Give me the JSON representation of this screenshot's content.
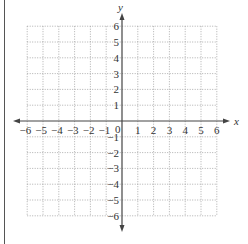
{
  "diagram": {
    "type": "coordinate-grid",
    "axes": {
      "x_label": "x",
      "y_label": "y",
      "x_min": -6,
      "x_max": 6,
      "y_min": -6,
      "y_max": 6,
      "origin_label": "0"
    },
    "x_tick_labels": [
      "−6",
      "−5",
      "−4",
      "−3",
      "−2",
      "−1",
      "1",
      "2",
      "3",
      "4",
      "5",
      "6"
    ],
    "y_tick_labels_positive": [
      "1",
      "2",
      "3",
      "4",
      "5",
      "6"
    ],
    "y_tick_labels_negative": [
      "−1",
      "−2",
      "−3",
      "−4",
      "−5",
      "−6"
    ],
    "grid": {
      "style": "dotted",
      "color": "#9a9a9a"
    },
    "axis_color": "#444444",
    "border_color": "#555555"
  }
}
